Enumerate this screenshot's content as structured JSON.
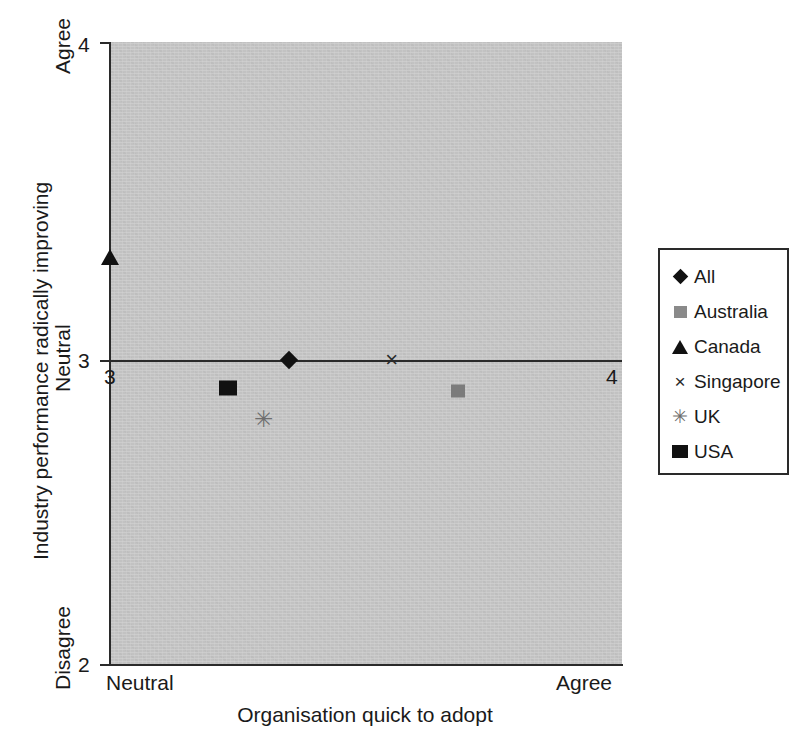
{
  "chart_data": {
    "type": "scatter",
    "title": "",
    "xlabel": "Organisation quick to adopt",
    "ylabel": "Industry performance radically improving",
    "xlim": [
      3,
      4
    ],
    "ylim": [
      2,
      4
    ],
    "grid": false,
    "legend_position": "right",
    "x_tick_labels": [
      "3",
      "4"
    ],
    "y_tick_labels": [
      "4",
      "3",
      "2"
    ],
    "x_anchor_labels": {
      "left": "Neutral",
      "right": "Agree"
    },
    "y_anchor_labels": {
      "top": "Agree",
      "middle": "Neutral",
      "bottom": "Disagree"
    },
    "reference_line": {
      "axis": "y",
      "value": 3
    },
    "plot_background": "#c2c2c2",
    "series": [
      {
        "name": "All",
        "marker": "diamond",
        "color": "#111111",
        "x": 3.35,
        "y": 2.98
      },
      {
        "name": "Australia",
        "marker": "square-gray",
        "color": "#7b7b7b",
        "x": 3.68,
        "y": 2.88
      },
      {
        "name": "Canada",
        "marker": "triangle",
        "color": "#111111",
        "x": 3.0,
        "y": 3.31
      },
      {
        "name": "Singapore",
        "marker": "x",
        "color": "#2a2a2a",
        "x": 3.55,
        "y": 2.98
      },
      {
        "name": "UK",
        "marker": "asterisk",
        "color": "#6e6e6e",
        "x": 3.3,
        "y": 2.79
      },
      {
        "name": "USA",
        "marker": "square-black",
        "color": "#111111",
        "x": 3.23,
        "y": 2.89
      }
    ]
  },
  "legend": {
    "items": [
      {
        "label": "All",
        "glyph": "♦"
      },
      {
        "label": "Australia",
        "glyph": "■"
      },
      {
        "label": "Canada",
        "glyph": "▲"
      },
      {
        "label": "Singapore",
        "glyph": "×"
      },
      {
        "label": "UK",
        "glyph": "✳"
      },
      {
        "label": "USA",
        "glyph": "■"
      }
    ]
  },
  "markers": {
    "singapore_glyph": "×",
    "uk_glyph": "✳"
  }
}
